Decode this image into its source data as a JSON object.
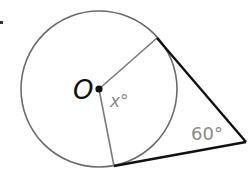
{
  "diagram": {
    "type": "geometry",
    "center_label": "O",
    "central_angle_label": "x°",
    "external_angle_label": "60°",
    "colors": {
      "circle": "#6b6b6b",
      "radius": "#7a7a7a",
      "tangent": "#111111",
      "center_dot": "#111111",
      "label_gray": "#8a8a8a",
      "label_dark": "#111111"
    },
    "geometry": {
      "center": [
        99,
        89
      ],
      "radius": 78,
      "tangent_point_top": [
        157,
        38
      ],
      "tangent_point_bottom": [
        114,
        166
      ],
      "external_point": [
        246,
        142
      ]
    }
  }
}
